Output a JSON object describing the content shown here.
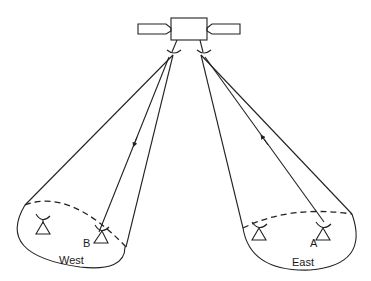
{
  "diagram": {
    "type": "satellite spot-beam coverage",
    "satellite": {
      "label": "",
      "position": [
        186,
        25
      ]
    },
    "regions": [
      {
        "name": "West",
        "label": "West",
        "stations": [
          {
            "id": "west-station-1",
            "label": ""
          },
          {
            "id": "west-station-B",
            "label": "B"
          }
        ]
      },
      {
        "name": "East",
        "label": "East",
        "stations": [
          {
            "id": "east-station-1",
            "label": ""
          },
          {
            "id": "east-station-A",
            "label": "A"
          }
        ]
      }
    ],
    "signal_path": "A → satellite → B",
    "colors": {
      "line": "#222222",
      "background": "#ffffff"
    }
  }
}
